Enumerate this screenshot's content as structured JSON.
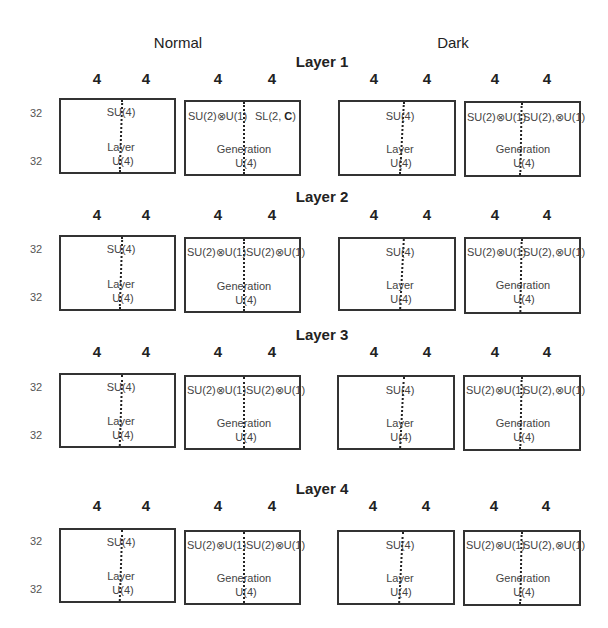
{
  "columns": {
    "normal": "Normal",
    "dark": "Dark"
  },
  "dim_label": "4",
  "row_label": "32",
  "layers": [
    {
      "title": "Layer 1",
      "normal": {
        "layer_box": {
          "top": "SU(4)",
          "name": "Layer",
          "bottom": "U(4)"
        },
        "generation_box": {
          "top_left": "SU(2)⊗U(1)",
          "top_right_prefix": "SL(2, ",
          "top_right_bold": "C",
          "top_right_suffix": ")",
          "name": "Generation",
          "bottom": "U(4)"
        }
      },
      "dark": {
        "layer_box": {
          "top": "SU(4)",
          "name": "Layer",
          "bottom": "U(4)"
        },
        "generation_box": {
          "top_left": "SU(2)⊗U(1)",
          "top_right": "SU(2),⊗U(1)",
          "name": "Generation",
          "bottom": "U(4)"
        }
      }
    },
    {
      "title": "Layer 2",
      "normal": {
        "layer_box": {
          "top": "SU(4)",
          "name": "Layer",
          "bottom": "U(4)"
        },
        "generation_box": {
          "top_left": "SU(2)⊗U(1)",
          "top_right": "SU(2)⊗U(1)",
          "name": "Generation",
          "bottom": "U(4)"
        }
      },
      "dark": {
        "layer_box": {
          "top": "SU(4)",
          "name": "Layer",
          "bottom": "U(4)"
        },
        "generation_box": {
          "top_left": "SU(2)⊗U(1)",
          "top_right": "SU(2),⊗U(1)",
          "name": "Generation",
          "bottom": "U(4)"
        }
      }
    },
    {
      "title": "Layer 3",
      "normal": {
        "layer_box": {
          "top": "SU(4)",
          "name": "Layer",
          "bottom": "U(4)"
        },
        "generation_box": {
          "top_left": "SU(2)⊗U(1)",
          "top_right": "SU(2)⊗U(1)",
          "name": "Generation",
          "bottom": "U(4)"
        }
      },
      "dark": {
        "layer_box": {
          "top": "SU(4)",
          "name": "Layer",
          "bottom": "U(4)"
        },
        "generation_box": {
          "top_left": "SU(2)⊗U(1)",
          "top_right": "SU(2),⊗U(1)",
          "name": "Generation",
          "bottom": "U(4)"
        }
      }
    },
    {
      "title": "Layer 4",
      "normal": {
        "layer_box": {
          "top": "SU(4)",
          "name": "Layer",
          "bottom": "U(4)"
        },
        "generation_box": {
          "top_left": "SU(2)⊗U(1)",
          "top_right": "SU(2)⊗U(1)",
          "name": "Generation",
          "bottom": "U(4)"
        }
      },
      "dark": {
        "layer_box": {
          "top": "SU(4)",
          "name": "Layer",
          "bottom": "U(4)"
        },
        "generation_box": {
          "top_left": "SU(2)⊗U(1)",
          "top_right": "SU(2),⊗U(1)",
          "name": "Generation",
          "bottom": "U(4)"
        }
      }
    }
  ]
}
